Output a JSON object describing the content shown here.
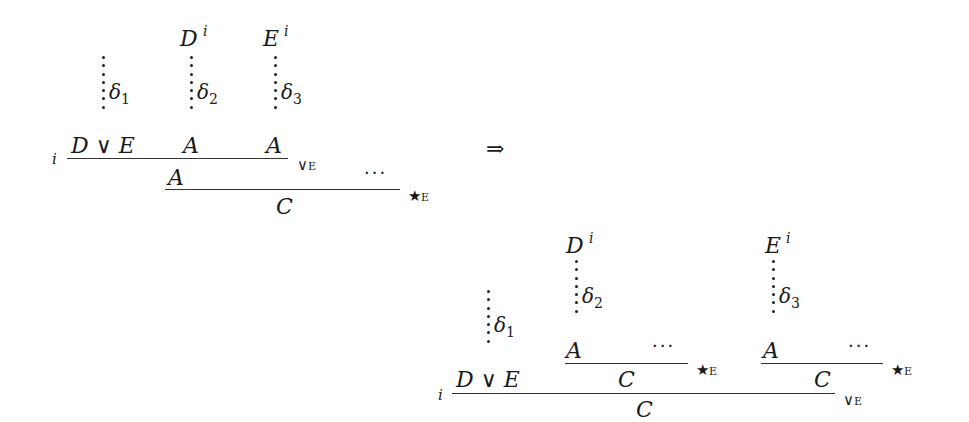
{
  "left_proof": {
    "hyp_D": "D",
    "hyp_E": "E",
    "discharge": "i",
    "deriv1": "δ",
    "deriv1_sub": "1",
    "deriv2": "δ",
    "deriv2_sub": "2",
    "deriv3": "δ",
    "deriv3_sub": "3",
    "premise_or": "D ∨ E",
    "premise_A1": "A",
    "premise_A2": "A",
    "rule_orE": "∨",
    "rule_orE_tag": "E",
    "concl_A": "A",
    "ellipsis": "···",
    "rule_starE": "★",
    "rule_starE_tag": "E",
    "concl_C": "C"
  },
  "arrow": "⇒",
  "right_proof": {
    "hyp_D": "D",
    "hyp_E": "E",
    "discharge": "i",
    "deriv1": "δ",
    "deriv1_sub": "1",
    "deriv2": "δ",
    "deriv2_sub": "2",
    "deriv3": "δ",
    "deriv3_sub": "3",
    "premise_or": "D ∨ E",
    "inner1_A": "A",
    "inner1_ellipsis": "···",
    "inner1_C": "C",
    "inner2_A": "A",
    "inner2_ellipsis": "···",
    "inner2_C": "C",
    "rule_starE": "★",
    "rule_starE_tag": "E",
    "rule_orE": "∨",
    "rule_orE_tag": "E",
    "concl_C": "C"
  }
}
